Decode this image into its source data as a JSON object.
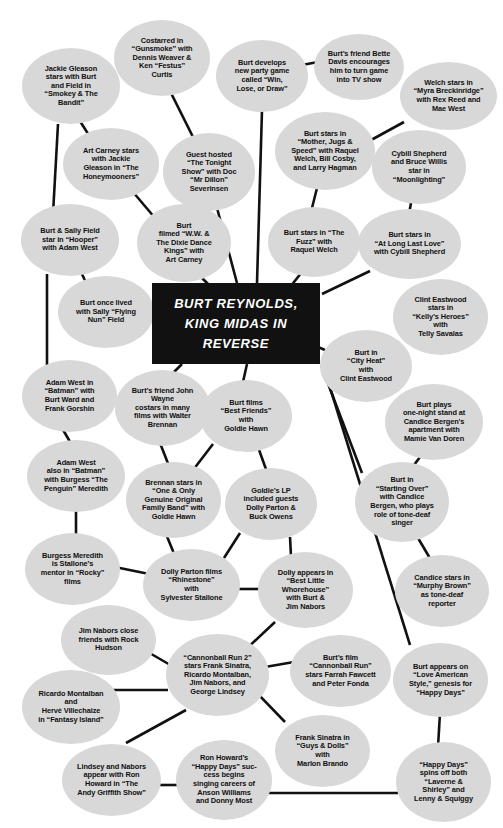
{
  "diagram": {
    "title": "Burt Reynolds, King Midas in Reverse",
    "type": "concept-map",
    "background_color": "#ffffff",
    "node_fill_color": "#d8d8d8",
    "node_text_color": "#101010",
    "center_fill_color": "#111111",
    "center_text_color": "#ffffff",
    "edge_color": "#111111"
  },
  "center": {
    "label": "BURT REYNOLDS,\nKING MIDAS IN\nREVERSE",
    "x": 152,
    "y": 283,
    "w": 168,
    "h": 81
  },
  "nodes": [
    {
      "id": "jackie-gleason-smokey",
      "label": "Jackie Gleason\nstars with Burt\nand Field in\n“Smokey & The\nBandit”",
      "x": 22,
      "y": 48,
      "w": 98,
      "h": 76
    },
    {
      "id": "costarred-gunsmoke",
      "label": "Costarred in\n“Gunsmoke” with\nDennis Weaver &\nKen “Festus”\nCurtis",
      "x": 114,
      "y": 20,
      "w": 96,
      "h": 76
    },
    {
      "id": "burt-develops-party-game",
      "label": "Burt develops\nnew party game\ncalled “Win,\nLose, or Draw”",
      "x": 216,
      "y": 40,
      "w": 92,
      "h": 72
    },
    {
      "id": "bette-davis-encourages",
      "label": "Burt’s friend Bette\nDavis encourages\nhim to turn game\ninto TV show",
      "x": 314,
      "y": 34,
      "w": 90,
      "h": 66
    },
    {
      "id": "welch-myra-breckinridge",
      "label": "Welch stars in\n“Myra Breckinridge”\nwith Rex Reed and\nMae West",
      "x": 400,
      "y": 62,
      "w": 97,
      "h": 68
    },
    {
      "id": "art-carney-honeymooners",
      "label": "Art Carney stars\nwith Jackie\nGleason in “The\nHoneymooners”",
      "x": 63,
      "y": 128,
      "w": 96,
      "h": 72
    },
    {
      "id": "guest-hosted-tonight-show",
      "label": "Guest hosted\n“The Tonight\nShow” with Doc\n“Mr Dillon”\nSeverinsen",
      "x": 163,
      "y": 133,
      "w": 92,
      "h": 78
    },
    {
      "id": "mother-jugs-speed",
      "label": "Burt stars in\n“Mother, Jugs &\nSpeed” with Raquel\nWelch, Bill Cosby,\nand Larry Hagman",
      "x": 275,
      "y": 112,
      "w": 100,
      "h": 78
    },
    {
      "id": "cybill-bruce-moonlighting",
      "label": "Cybill Shepherd\nand Bruce Willis\nstar in\n“Moonlighting”",
      "x": 372,
      "y": 130,
      "w": 94,
      "h": 74
    },
    {
      "id": "burt-sally-hooper",
      "label": "Burt & Sally Field\nstar in “Hooper”\nwith Adam West",
      "x": 21,
      "y": 204,
      "w": 98,
      "h": 72
    },
    {
      "id": "ww-dixie-dance-kings",
      "label": "Burt\nfilmed “W.W. &\nThe Dixie Dance\nKings” with\nArt Carney",
      "x": 137,
      "y": 204,
      "w": 94,
      "h": 78
    },
    {
      "id": "the-fuzz",
      "label": "Burt stars in “The\nFuzz” with\nRaquel Welch",
      "x": 268,
      "y": 207,
      "w": 92,
      "h": 70
    },
    {
      "id": "at-long-last-love",
      "label": "Burt stars in\n“At Long Last Love”\nwith Cybill Shepherd",
      "x": 358,
      "y": 209,
      "w": 103,
      "h": 70
    },
    {
      "id": "sally-flying-nun",
      "label": "Burt once lived\nwith Sally “Flying\nNun” Field",
      "x": 58,
      "y": 276,
      "w": 96,
      "h": 72
    },
    {
      "id": "kellys-heroes",
      "label": "Clint Eastwood\nstars in\n“Kelly’s Heroes”\nwith\nTelly Savalas",
      "x": 393,
      "y": 279,
      "w": 95,
      "h": 76
    },
    {
      "id": "city-heat",
      "label": "Burt in\n“City Heat”\nwith\nClint Eastwood",
      "x": 320,
      "y": 330,
      "w": 92,
      "h": 72
    },
    {
      "id": "adam-west-batman",
      "label": "Adam West in\n“Batman” with\nBurt Ward and\nFrank Gorshin",
      "x": 22,
      "y": 360,
      "w": 95,
      "h": 72
    },
    {
      "id": "john-wayne-walter-brennan",
      "label": "Burt’s friend John\nWayne\ncostars in many\nfilms with Walter\nBrennan",
      "x": 115,
      "y": 370,
      "w": 95,
      "h": 76
    },
    {
      "id": "best-friends-goldie",
      "label": "Burt films\n“Best Friends”\nwith\nGoldie Hawn",
      "x": 200,
      "y": 380,
      "w": 92,
      "h": 72
    },
    {
      "id": "burt-plays-one-night",
      "label": "Burt plays\none-night stand at\nCandice Bergen’s\napartment with\nMamie Van Doren",
      "x": 385,
      "y": 384,
      "w": 98,
      "h": 76
    },
    {
      "id": "adam-west-penguin",
      "label": "Adam West\nalso in “Batman”\nwith Burgess “The\nPenguin” Meredith",
      "x": 27,
      "y": 440,
      "w": 98,
      "h": 72
    },
    {
      "id": "brennan-family-band",
      "label": "Brennan stars in\n“One & Only\nGenuine Original\nFamily Band” with\nGoldie Hawn",
      "x": 126,
      "y": 462,
      "w": 95,
      "h": 76
    },
    {
      "id": "goldies-lp",
      "label": "Goldie’s LP\nincluded guests\nDolly Parton &\nBuck Owens",
      "x": 225,
      "y": 468,
      "w": 92,
      "h": 72
    },
    {
      "id": "starting-over",
      "label": "Burt in\n“Starting Over”\nwith Candice\nBergen, who plays\nrole of tone-deaf\nsinger",
      "x": 355,
      "y": 462,
      "w": 94,
      "h": 80
    },
    {
      "id": "burgess-meredith-rocky",
      "label": "Burgess Meredith\nis Stallone’s\nmentor in “Rocky”\nfilms",
      "x": 25,
      "y": 533,
      "w": 95,
      "h": 72
    },
    {
      "id": "dolly-rhinestone",
      "label": "Dolly Parton films\n“Rhinestone”\nwith\nSylvester Stallone",
      "x": 143,
      "y": 549,
      "w": 97,
      "h": 72
    },
    {
      "id": "dolly-best-little-whorehouse",
      "label": "Dolly appears in\n“Best Little\nWhorehouse”\nwith Burt &\nJim Nabors",
      "x": 258,
      "y": 552,
      "w": 95,
      "h": 76
    },
    {
      "id": "candice-murphy-brown",
      "label": "Candice stars in\n“Murphy Brown”\nas tone-deaf\nreporter",
      "x": 395,
      "y": 555,
      "w": 94,
      "h": 72
    },
    {
      "id": "jim-nabors-rock-hudson",
      "label": "Jim Nabors close\nfriends with Rock\nHudson",
      "x": 61,
      "y": 605,
      "w": 95,
      "h": 70
    },
    {
      "id": "cannonball-run-2",
      "label": "“Cannonball Run 2”\nstars Frank Sinatra,\nRicardo Montalban,\nJim Nabors, and\nGeorge Lindsey",
      "x": 166,
      "y": 634,
      "w": 103,
      "h": 82
    },
    {
      "id": "cannonball-run",
      "label": "Burt’s film\n“Cannonball Run”\nstars Farrah Fawcett\nand Peter Fonda",
      "x": 290,
      "y": 635,
      "w": 101,
      "h": 72
    },
    {
      "id": "love-american-style",
      "label": "Burt appears on\n“Love American\nStyle,” genesis for\n“Happy Days”",
      "x": 393,
      "y": 643,
      "w": 95,
      "h": 74
    },
    {
      "id": "montalban-fantasy-island",
      "label": "Ricardo Montalban\nand\nHervé Villechaize\nin “Fantasy Island”",
      "x": 22,
      "y": 670,
      "w": 98,
      "h": 74
    },
    {
      "id": "frank-sinatra-guys-dolls",
      "label": "Frank Sinatra in\n“Guys & Dolls”\nwith\nMarlon Brando",
      "x": 275,
      "y": 715,
      "w": 95,
      "h": 72
    },
    {
      "id": "lindsey-nabors-andy-griffith",
      "label": "Lindsey and Nabors\nappear with Ron\nHoward in “The\nAndy Griffith Show”",
      "x": 62,
      "y": 744,
      "w": 99,
      "h": 72
    },
    {
      "id": "ron-howard-happy-days",
      "label": "Ron Howard’s\n“Happy Days” suc-\ncess begins\nsinging careers of\nAnson Williams\nand Donny Most",
      "x": 176,
      "y": 740,
      "w": 96,
      "h": 80
    },
    {
      "id": "happy-days-spinoffs",
      "label": "“Happy Days”\nspins off both\n“Laverne &\nShirley” and\nLenny & Squiggy",
      "x": 396,
      "y": 742,
      "w": 95,
      "h": 80
    }
  ],
  "edges": [
    {
      "from": "jackie-gleason-smokey",
      "to": "burt-sally-hooper",
      "x1": 58,
      "y1": 124,
      "x2": 53,
      "y2": 214
    },
    {
      "from": "jackie-gleason-smokey",
      "to": "art-carney-honeymooners",
      "x1": 78,
      "y1": 118,
      "x2": 92,
      "y2": 140
    },
    {
      "from": "costarred-gunsmoke",
      "to": "guest-hosted-tonight-show",
      "x1": 171,
      "y1": 93,
      "x2": 196,
      "y2": 143
    },
    {
      "from": "burt-develops-party-game",
      "to": "bette-davis-encourages",
      "x1": 302,
      "y1": 65,
      "x2": 318,
      "y2": 62
    },
    {
      "from": "burt-develops-party-game",
      "to": "center",
      "x1": 262,
      "y1": 110,
      "x2": 257,
      "y2": 283
    },
    {
      "from": "welch-myra-breckinridge",
      "to": "mother-jugs-speed",
      "x1": 404,
      "y1": 122,
      "x2": 362,
      "y2": 145
    },
    {
      "from": "art-carney-honeymooners",
      "to": "ww-dixie-dance-kings",
      "x1": 133,
      "y1": 192,
      "x2": 155,
      "y2": 218
    },
    {
      "from": "guest-hosted-tonight-show",
      "to": "center",
      "x1": 217,
      "y1": 208,
      "x2": 237,
      "y2": 283
    },
    {
      "from": "mother-jugs-speed",
      "to": "the-fuzz",
      "x1": 317,
      "y1": 188,
      "x2": 311,
      "y2": 212
    },
    {
      "from": "cybill-bruce-moonlighting",
      "to": "at-long-last-love",
      "x1": 411,
      "y1": 203,
      "x2": 409,
      "y2": 214
    },
    {
      "from": "burt-sally-hooper",
      "to": "sally-flying-nun",
      "x1": 81,
      "y1": 272,
      "x2": 89,
      "y2": 289
    },
    {
      "from": "burt-sally-hooper",
      "to": "adam-west-batman",
      "x1": 47,
      "y1": 274,
      "x2": 47,
      "y2": 366
    },
    {
      "from": "ww-dixie-dance-kings",
      "to": "center",
      "x1": 199,
      "y1": 275,
      "x2": 211,
      "y2": 287
    },
    {
      "from": "the-fuzz",
      "to": "center",
      "x1": 302,
      "y1": 272,
      "x2": 290,
      "y2": 287
    },
    {
      "from": "at-long-last-love",
      "to": "center",
      "x1": 370,
      "y1": 271,
      "x2": 322,
      "y2": 294
    },
    {
      "from": "sally-flying-nun",
      "to": "center",
      "x1": 150,
      "y1": 320,
      "x2": 155,
      "y2": 323
    },
    {
      "from": "kellys-heroes",
      "to": "city-heat",
      "x1": 400,
      "y1": 343,
      "x2": 381,
      "y2": 352
    },
    {
      "from": "city-heat",
      "to": "center",
      "x1": 325,
      "y1": 350,
      "x2": 318,
      "y2": 347
    },
    {
      "from": "adam-west-batman",
      "to": "adam-west-penguin",
      "x1": 62,
      "y1": 428,
      "x2": 73,
      "y2": 447
    },
    {
      "from": "john-wayne-walter-brennan",
      "to": "center",
      "x1": 171,
      "y1": 375,
      "x2": 182,
      "y2": 364
    },
    {
      "from": "john-wayne-walter-brennan",
      "to": "brennan-family-band",
      "x1": 160,
      "y1": 443,
      "x2": 169,
      "y2": 466
    },
    {
      "from": "best-friends-goldie",
      "to": "center",
      "x1": 243,
      "y1": 382,
      "x2": 247,
      "y2": 364
    },
    {
      "from": "best-friends-goldie",
      "to": "brennan-family-band",
      "x1": 213,
      "y1": 444,
      "x2": 190,
      "y2": 474
    },
    {
      "from": "best-friends-goldie",
      "to": "goldies-lp",
      "x1": 258,
      "y1": 447,
      "x2": 267,
      "y2": 472
    },
    {
      "from": "burt-plays-one-night",
      "to": "starting-over",
      "x1": 420,
      "y1": 457,
      "x2": 408,
      "y2": 473
    },
    {
      "from": "adam-west-penguin",
      "to": "burgess-meredith-rocky",
      "x1": 76,
      "y1": 510,
      "x2": 76,
      "y2": 539
    },
    {
      "from": "brennan-family-band",
      "to": "dolly-rhinestone",
      "x1": 166,
      "y1": 534,
      "x2": 175,
      "y2": 556
    },
    {
      "from": "goldies-lp",
      "to": "dolly-rhinestone",
      "x1": 240,
      "y1": 533,
      "x2": 224,
      "y2": 558
    },
    {
      "from": "goldies-lp",
      "to": "dolly-best-little-whorehouse",
      "x1": 290,
      "y1": 537,
      "x2": 291,
      "y2": 556
    },
    {
      "from": "starting-over",
      "to": "center",
      "x1": 362,
      "y1": 473,
      "x2": 321,
      "y2": 365
    },
    {
      "from": "starting-over",
      "to": "candice-murphy-brown",
      "x1": 418,
      "y1": 538,
      "x2": 431,
      "y2": 560
    },
    {
      "from": "burgess-meredith-rocky",
      "to": "dolly-rhinestone",
      "x1": 110,
      "y1": 566,
      "x2": 154,
      "y2": 575
    },
    {
      "from": "dolly-rhinestone",
      "to": "dolly-best-little-whorehouse",
      "x1": 236,
      "y1": 589,
      "x2": 262,
      "y2": 589
    },
    {
      "from": "dolly-best-little-whorehouse",
      "to": "cannonball-run-2",
      "x1": 275,
      "y1": 622,
      "x2": 243,
      "y2": 652
    },
    {
      "from": "jim-nabors-rock-hudson",
      "to": "cannonball-run-2",
      "x1": 141,
      "y1": 648,
      "x2": 172,
      "y2": 666
    },
    {
      "from": "cannonball-run-2",
      "to": "cannonball-run",
      "x1": 265,
      "y1": 667,
      "x2": 294,
      "y2": 662
    },
    {
      "from": "cannonball-run-2",
      "to": "frank-sinatra-guys-dolls",
      "x1": 254,
      "y1": 690,
      "x2": 285,
      "y2": 722
    },
    {
      "from": "cannonball-run-2",
      "to": "montalban-fantasy-island",
      "x1": 168,
      "y1": 690,
      "x2": 112,
      "y2": 690
    },
    {
      "from": "cannonball-run-2",
      "to": "lindsey-nabors-andy-griffith",
      "x1": 186,
      "y1": 710,
      "x2": 126,
      "y2": 743
    },
    {
      "from": "love-american-style",
      "to": "center",
      "x1": 410,
      "y1": 645,
      "x2": 323,
      "y2": 365
    },
    {
      "from": "love-american-style",
      "to": "happy-days-spinoffs",
      "x1": 440,
      "y1": 713,
      "x2": 438,
      "y2": 747
    },
    {
      "from": "lindsey-nabors-andy-griffith",
      "to": "ron-howard-happy-days",
      "x1": 156,
      "y1": 785,
      "x2": 182,
      "y2": 785
    },
    {
      "from": "ron-howard-happy-days",
      "to": "happy-days-spinoffs",
      "x1": 266,
      "y1": 793,
      "x2": 398,
      "y2": 793
    }
  ]
}
